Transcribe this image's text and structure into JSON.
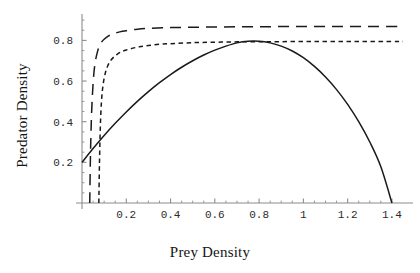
{
  "chart_data": {
    "type": "line",
    "title": "",
    "xlabel": "Prey Density",
    "ylabel": "Predator Density",
    "xlim": [
      0,
      1.45
    ],
    "ylim": [
      0,
      0.93
    ],
    "grid": false,
    "legend": "none",
    "xticks": [
      "0.2",
      "0.4",
      "0.6",
      "0.8",
      "1",
      "1.2",
      "1.4"
    ],
    "xtick_values": [
      0.2,
      0.4,
      0.6,
      0.8,
      1,
      1.2,
      1.4
    ],
    "yticks": [
      "0.2",
      "0.4",
      "0.6",
      "0.8"
    ],
    "ytick_values": [
      0.2,
      0.4,
      0.6,
      0.8
    ],
    "series": [
      {
        "name": "prey-isocline-solid",
        "style": "solid",
        "color": "#1a1a1a",
        "x": [
          0,
          0.05,
          0.1,
          0.15,
          0.2,
          0.25,
          0.3,
          0.35,
          0.4,
          0.45,
          0.5,
          0.55,
          0.6,
          0.65,
          0.7,
          0.75,
          0.8,
          0.85,
          0.9,
          0.95,
          1,
          1.05,
          1.1,
          1.15,
          1.2,
          1.25,
          1.3,
          1.35,
          1.4
        ],
        "values": [
          0.2,
          0.268,
          0.332,
          0.392,
          0.448,
          0.5,
          0.548,
          0.592,
          0.632,
          0.668,
          0.7,
          0.728,
          0.752,
          0.772,
          0.788,
          0.796,
          0.796,
          0.788,
          0.772,
          0.748,
          0.715,
          0.672,
          0.62,
          0.558,
          0.485,
          0.4,
          0.3,
          0.178,
          0.0
        ]
      },
      {
        "name": "predator-isocline-long-dash",
        "style": "long-dash",
        "color": "#1a1a1a",
        "x": [
          0.035,
          0.038,
          0.042,
          0.047,
          0.053,
          0.06,
          0.07,
          0.08,
          0.09,
          0.1,
          0.12,
          0.14,
          0.17,
          0.2,
          0.25,
          0.3,
          0.4,
          0.5,
          0.6,
          0.7,
          0.8,
          0.9,
          1,
          1.1,
          1.2,
          1.3,
          1.4,
          1.45
        ],
        "values": [
          0.0,
          0.22,
          0.4,
          0.53,
          0.63,
          0.695,
          0.745,
          0.775,
          0.794,
          0.806,
          0.822,
          0.832,
          0.842,
          0.848,
          0.855,
          0.859,
          0.863,
          0.865,
          0.866,
          0.867,
          0.867,
          0.868,
          0.868,
          0.868,
          0.868,
          0.868,
          0.868,
          0.868
        ]
      },
      {
        "name": "predator-isocline-short-dash",
        "style": "short-dash",
        "color": "#1a1a1a",
        "x": [
          0.076,
          0.079,
          0.083,
          0.088,
          0.095,
          0.105,
          0.115,
          0.13,
          0.145,
          0.16,
          0.18,
          0.2,
          0.23,
          0.26,
          0.3,
          0.35,
          0.4,
          0.5,
          0.6,
          0.7,
          0.8,
          0.9,
          1,
          1.1,
          1.2,
          1.3,
          1.4,
          1.45
        ],
        "values": [
          0.0,
          0.2,
          0.38,
          0.5,
          0.58,
          0.638,
          0.672,
          0.702,
          0.72,
          0.733,
          0.745,
          0.753,
          0.762,
          0.769,
          0.775,
          0.781,
          0.784,
          0.789,
          0.791,
          0.793,
          0.794,
          0.794,
          0.795,
          0.795,
          0.795,
          0.795,
          0.795,
          0.795
        ]
      }
    ],
    "annotations": []
  }
}
